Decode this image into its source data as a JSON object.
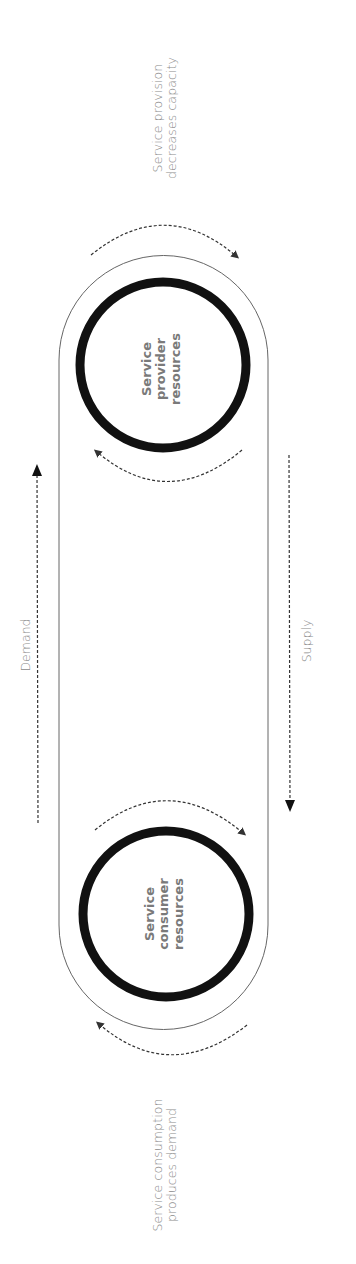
{
  "diagram": {
    "type": "cycle",
    "orientation": "rotated-90",
    "nodes": {
      "provider": {
        "lines": [
          "Service",
          "provider",
          "resources"
        ]
      },
      "consumer": {
        "lines": [
          "Service",
          "consumer",
          "resources"
        ]
      }
    },
    "annotations": {
      "provider": {
        "lines": [
          "Service provision",
          "decreases capacity"
        ]
      },
      "consumer": {
        "lines": [
          "Service consumption",
          "produces demand"
        ]
      }
    },
    "flows": {
      "demand": {
        "label": "Demand",
        "direction": "consumer-to-provider"
      },
      "supply": {
        "label": "Supply",
        "direction": "provider-to-consumer"
      }
    },
    "colors": {
      "stroke_dark": "#111111",
      "stroke_line": "#555555",
      "text_gray": "#8a8a8a"
    }
  }
}
